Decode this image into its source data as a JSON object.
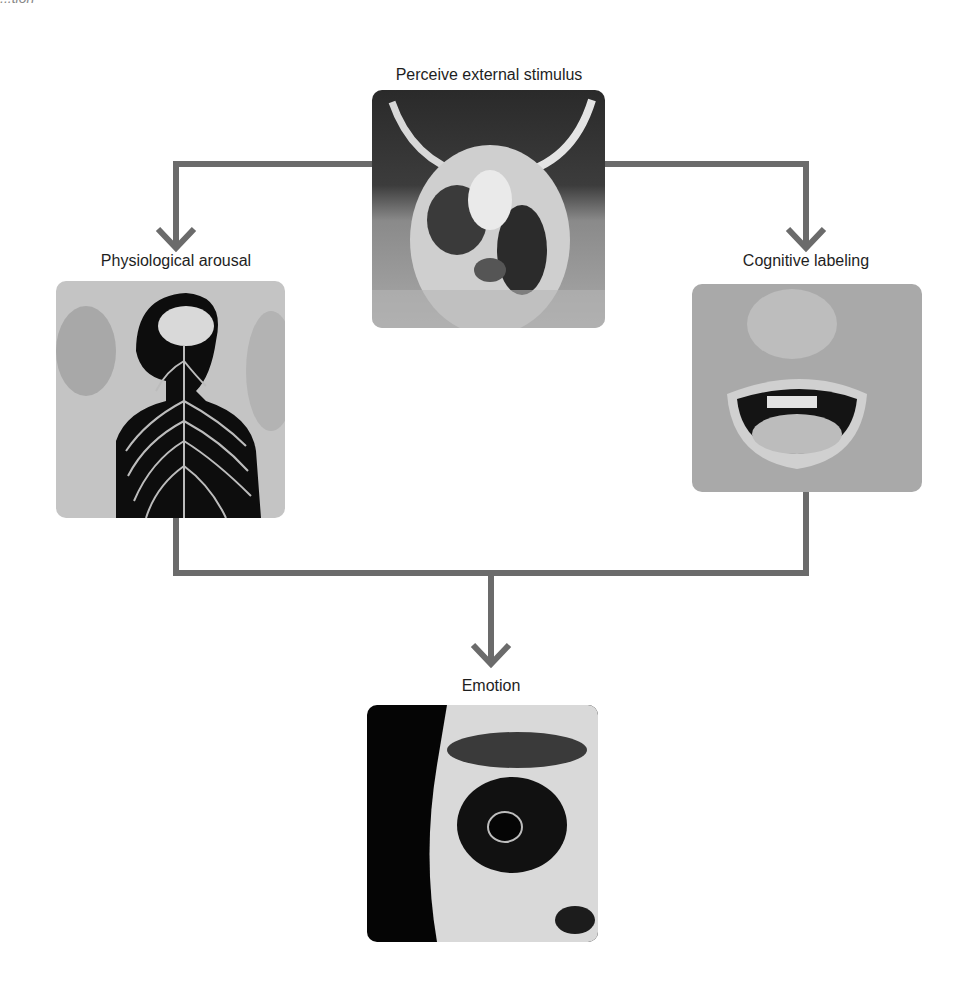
{
  "figure": {
    "top_clipped_text": "...tion",
    "connector_color": "#6b6b6b",
    "arrowhead_color": "#6b6b6b",
    "nodes": [
      {
        "id": "stimulus",
        "label": "Perceive external stimulus",
        "image": "longhorn-steer-photo"
      },
      {
        "id": "arousal",
        "label": "Physiological arousal",
        "image": "nervous-system-silhouette"
      },
      {
        "id": "labeling",
        "label": "Cognitive labeling",
        "image": "screaming-mouth-photo"
      },
      {
        "id": "emotion",
        "label": "Emotion",
        "image": "fearful-eye-photo"
      }
    ],
    "edges": [
      {
        "from": "stimulus",
        "to": "arousal"
      },
      {
        "from": "stimulus",
        "to": "labeling"
      },
      {
        "from": "arousal",
        "to": "emotion"
      },
      {
        "from": "labeling",
        "to": "emotion"
      }
    ]
  }
}
